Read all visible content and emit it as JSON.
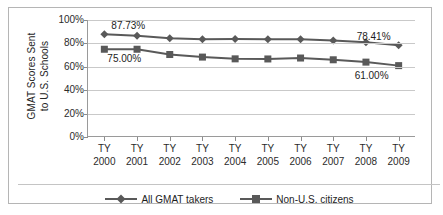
{
  "chart_data": {
    "type": "line",
    "title": "",
    "xlabel": "",
    "ylabel": "GMAT Scores Sent to U.S. Schools",
    "ylabel_lines": [
      "GMAT Scores Sent",
      "to U.S. Schools"
    ],
    "categories": [
      "TY 2000",
      "TY 2001",
      "TY 2002",
      "TY 2003",
      "TY 2004",
      "TY 2005",
      "TY 2006",
      "TY 2007",
      "TY 2008",
      "TY 2009"
    ],
    "category_lines": [
      {
        "l1": "TY",
        "l2": "2000"
      },
      {
        "l1": "TY",
        "l2": "2001"
      },
      {
        "l1": "TY",
        "l2": "2002"
      },
      {
        "l1": "TY",
        "l2": "2003"
      },
      {
        "l1": "TY",
        "l2": "2004"
      },
      {
        "l1": "TY",
        "l2": "2005"
      },
      {
        "l1": "TY",
        "l2": "2006"
      },
      {
        "l1": "TY",
        "l2": "2007"
      },
      {
        "l1": "TY",
        "l2": "2008"
      },
      {
        "l1": "TY",
        "l2": "2009"
      }
    ],
    "series": [
      {
        "name": "All GMAT takers",
        "marker": "diamond",
        "color": "#595959",
        "values": [
          87.73,
          86.5,
          84.5,
          83.5,
          83.7,
          83.5,
          83.6,
          82.5,
          81.0,
          78.41
        ]
      },
      {
        "name": "Non-U.S. citizens",
        "marker": "square",
        "color": "#595959",
        "values": [
          75.0,
          75.0,
          70.5,
          68.3,
          66.8,
          66.7,
          67.5,
          66.0,
          64.0,
          61.0
        ]
      }
    ],
    "ylim": [
      0,
      100
    ],
    "yticks": [
      0,
      20,
      40,
      60,
      80,
      100
    ],
    "ytick_labels": [
      "0%",
      "20%",
      "40%",
      "60%",
      "80%",
      "100%"
    ],
    "grid": true,
    "legend_position": "bottom",
    "annotations": [
      {
        "text": "87.73%",
        "series": "All GMAT takers",
        "category": "TY 2000",
        "position": "above-right"
      },
      {
        "text": "75.00%",
        "series": "Non-U.S. citizens",
        "category": "TY 2000",
        "position": "below-right"
      },
      {
        "text": "78.41%",
        "series": "All GMAT takers",
        "category": "TY 2009",
        "position": "above-left"
      },
      {
        "text": "61.00%",
        "series": "Non-U.S. citizens",
        "category": "TY 2009",
        "position": "below-left"
      }
    ]
  },
  "colors": {
    "line": "#595959",
    "grid": "#c9c9c9",
    "axis": "#9a9a9a",
    "border": "#b5b5b5",
    "text": "#1d1d1d",
    "background": "#ffffff"
  }
}
